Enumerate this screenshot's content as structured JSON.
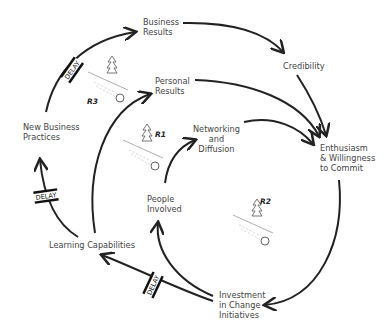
{
  "diagram": {
    "type": "causal-loop",
    "nodes": [
      {
        "id": "business_results",
        "line1": "Business",
        "line2": "Results"
      },
      {
        "id": "credibility",
        "line1": "Credibility",
        "line2": ""
      },
      {
        "id": "personal_results",
        "line1": "Personal",
        "line2": "Results"
      },
      {
        "id": "networking",
        "line1": "Networking",
        "line2": "and",
        "line3": "Diffusion"
      },
      {
        "id": "enthusiasm",
        "line1": "Enthusiasm",
        "line2": "& Willingness",
        "line3": "to Commit"
      },
      {
        "id": "new_practices",
        "line1": "New Business",
        "line2": "Practices"
      },
      {
        "id": "people_involved",
        "line1": "People",
        "line2": "Involved"
      },
      {
        "id": "learning",
        "line1": "Learning Capabilities"
      },
      {
        "id": "investment",
        "line1": "Investment",
        "line2": "in Change",
        "line3": "Initiatives"
      }
    ],
    "loops": [
      {
        "label": "R1",
        "type": "reinforcing",
        "icon": "snowball-icon"
      },
      {
        "label": "R2",
        "type": "reinforcing",
        "icon": "snowball-icon"
      },
      {
        "label": "R3",
        "type": "reinforcing",
        "icon": "snowball-icon"
      }
    ],
    "delay_label": "DELAY",
    "edges": [
      {
        "from": "new_practices",
        "to": "business_results",
        "delay": true
      },
      {
        "from": "business_results",
        "to": "credibility"
      },
      {
        "from": "credibility",
        "to": "enthusiasm"
      },
      {
        "from": "personal_results",
        "to": "enthusiasm"
      },
      {
        "from": "networking",
        "to": "enthusiasm"
      },
      {
        "from": "enthusiasm",
        "to": "investment"
      },
      {
        "from": "investment",
        "to": "learning",
        "delay": true
      },
      {
        "from": "investment",
        "to": "people_involved"
      },
      {
        "from": "people_involved",
        "to": "networking"
      },
      {
        "from": "learning",
        "to": "personal_results"
      },
      {
        "from": "learning",
        "to": "new_practices",
        "delay": true
      }
    ]
  }
}
